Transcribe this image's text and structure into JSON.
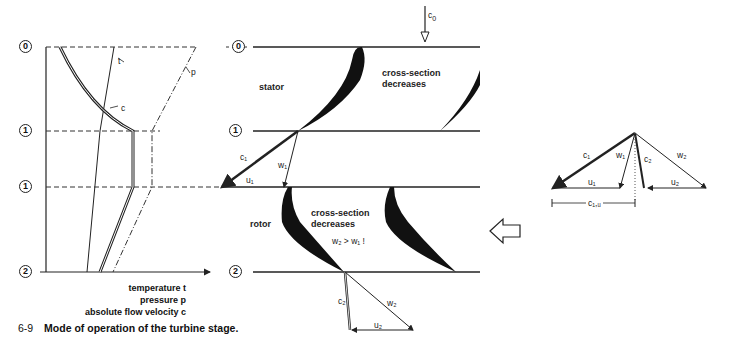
{
  "figure": {
    "number": "6-9",
    "caption": "Mode of operation of the turbine stage."
  },
  "left_chart": {
    "stations": [
      "0",
      "1",
      "1",
      "2"
    ],
    "curve_labels": {
      "temperature": "t",
      "pressure": "p",
      "velocity": "c"
    },
    "axis_labels": [
      "temperature t",
      "pressure p",
      "absolute flow velocity c"
    ]
  },
  "middle_diagram": {
    "stations": [
      "0",
      "1",
      "2"
    ],
    "inlet_velocity": "c",
    "inlet_velocity_sub": "0",
    "stator_label": "stator",
    "rotor_label": "rotor",
    "stator_note_line1": "cross-section",
    "stator_note_line2": "decreases",
    "rotor_note_line1": "cross-section",
    "rotor_note_line2": "decreases",
    "rotor_condition": "w₂ > w₁ !",
    "inlet_triangle": {
      "c": "c₁",
      "w": "w₁",
      "u": "u₁"
    },
    "outlet_triangle": {
      "c": "c₂",
      "w": "w₂",
      "u": "u₂"
    }
  },
  "right_diagram": {
    "labels": {
      "c1": "c₁",
      "w1": "w₁",
      "c2": "c₂",
      "w2": "w₂",
      "u1": "u₁",
      "u2": "u₂",
      "c1u": "c₁,ᵤ"
    }
  }
}
